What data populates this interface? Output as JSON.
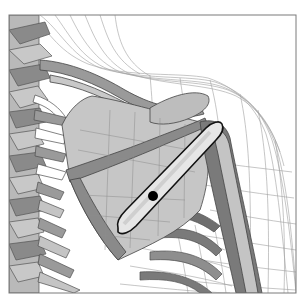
{
  "figure": {
    "caption": "3D shoulder model: spine, rib cage, clavicle, scapula and humerus inside wireframe skin mesh, with highlighted capsule outline and marker dot",
    "colors": {
      "background": "#ffffff",
      "frame": "#7a7a7a",
      "bone_light": "#c4c4c4",
      "bone_mid": "#a8a8a8",
      "bone_dark": "#6e6e6e",
      "mesh": "#9a9a9a",
      "capsule_fill": "#e6e6e6",
      "capsule_stroke": "#111111",
      "marker": "#000000"
    },
    "frame": {
      "x": 9,
      "y": 15,
      "width": 287,
      "height": 278
    },
    "marker": {
      "cx": 153,
      "cy": 196,
      "r": 5
    },
    "capsule": {
      "x1": 124,
      "y1": 232,
      "x2": 217,
      "y2": 124
    }
  }
}
